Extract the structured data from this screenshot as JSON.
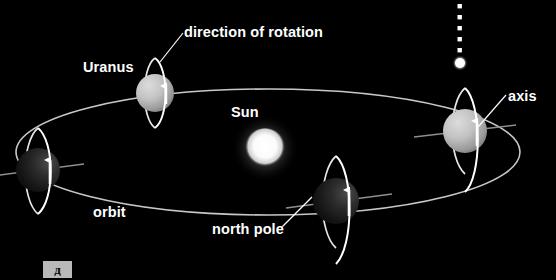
{
  "figure": {
    "background_color": "#000000",
    "title_text": "",
    "labels": {
      "direction_of_rotation": "direction of rotation",
      "uranus": "Uranus",
      "sun": "Sun",
      "axis": "axis",
      "orbit": "orbit",
      "north_pole": "north pole"
    },
    "corner_tab": {
      "text": "д",
      "background_color": "#b9b9b9",
      "text_color": "#0a0a0a"
    }
  },
  "colors": {
    "background": "#000000",
    "label_text": "#ffffff",
    "orbit_line": "#c8c8c8",
    "ring_line": "#ffffff",
    "axis_line": "#9a9a9a",
    "leader_line": "#ffffff",
    "sun_core": "#ffffff",
    "sun_glow": "#e8e8e8",
    "planet_lit": "#bdbdbd",
    "planet_dark": "#1c1c1c",
    "pole_star": "#ffffff"
  },
  "orbit": {
    "center_x": 268,
    "center_y": 152,
    "radius_x": 252,
    "radius_y": 63,
    "stroke_width": 1.6
  },
  "sun": {
    "center_x": 265,
    "center_y": 148,
    "radius": 19
  },
  "pole_star_marker": {
    "x": 460,
    "dot_count": 6,
    "dot_top_y": 6,
    "dot_spacing": 11,
    "dot_size": 4,
    "star_y": 62,
    "star_radius": 5.5
  },
  "planets": [
    {
      "name": "uranus-top-left",
      "cx": 155,
      "cy": 93,
      "r": 19,
      "shading": "lit",
      "ring_rx": 13,
      "ring_ry": 35,
      "ring_tilt_deg": -6,
      "has_axis_line": false,
      "arrow_direction": "up"
    },
    {
      "name": "uranus-left",
      "cx": 38,
      "cy": 170,
      "r": 22,
      "shading": "dark",
      "ring_rx": 14,
      "ring_ry": 42,
      "ring_tilt_deg": -7,
      "has_axis_line": true,
      "axis_half_length": 44,
      "axis_angle_deg": -6,
      "arrow_direction": "up"
    },
    {
      "name": "uranus-bottom",
      "cx": 336,
      "cy": 201,
      "r": 23,
      "shading": "dark",
      "ring_rx": 15,
      "ring_ry": 45,
      "ring_tilt_deg": -6,
      "has_axis_line": true,
      "axis_half_length": 46,
      "axis_angle_deg": -5,
      "arrow_direction": "up"
    },
    {
      "name": "uranus-right",
      "cx": 465,
      "cy": 131,
      "r": 22,
      "shading": "lit",
      "ring_rx": 14,
      "ring_ry": 43,
      "ring_tilt_deg": -5,
      "has_axis_line": true,
      "axis_half_length": 45,
      "axis_angle_deg": -5,
      "arrow_direction": "up"
    }
  ],
  "leader_lines": [
    {
      "name": "rotation-leader",
      "x1": 183,
      "y1": 33,
      "x2": 160,
      "y2": 62
    },
    {
      "name": "axis-leader",
      "x1": 506,
      "y1": 95,
      "x2": 478,
      "y2": 127
    },
    {
      "name": "north-pole-leader",
      "x1": 280,
      "y1": 228,
      "x2": 310,
      "y2": 198
    }
  ]
}
